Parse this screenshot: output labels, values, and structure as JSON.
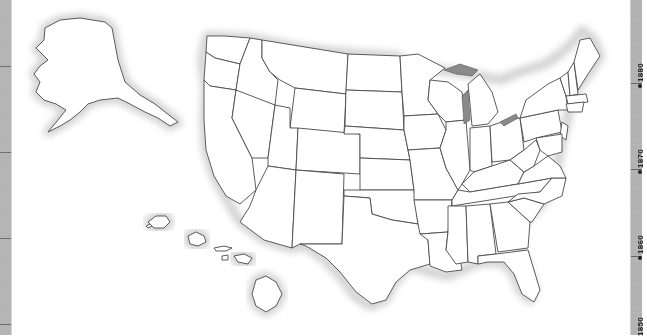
{
  "map": {
    "title": "United States outline map",
    "regions": [
      "Alaska",
      "Hawaii",
      "Contiguous United States"
    ],
    "style": {
      "fill": "#ffffff",
      "border": "#4a4a4a",
      "shadow": "#7a7a7a",
      "lakes": "#8a8a8a"
    }
  },
  "timeline": {
    "strip_color": "#b3b3b3",
    "labels": [
      {
        "year": "1880",
        "y": 83
      },
      {
        "year": "1870",
        "y": 169
      },
      {
        "year": "1860",
        "y": 256
      },
      {
        "year": "1850",
        "y": 322
      }
    ]
  },
  "left_strip": {
    "ticks": [
      66,
      152,
      238,
      324
    ]
  }
}
